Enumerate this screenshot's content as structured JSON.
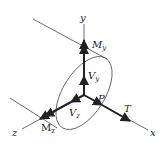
{
  "diagram": {
    "colors": {
      "line": "#222222",
      "thin": "#444444",
      "background": "#ffffff"
    },
    "axes": {
      "x": {
        "label": "x"
      },
      "y": {
        "label": "y"
      },
      "z": {
        "label": "z"
      }
    },
    "point": {
      "label": "P"
    },
    "forces": {
      "T": {
        "label": "T"
      },
      "Vy": {
        "main": "V",
        "sub": "y"
      },
      "Vz": {
        "main": "V",
        "sub": "z"
      },
      "My": {
        "main": "M",
        "sub": "y"
      },
      "Mz": {
        "main": "M",
        "sub": "z"
      }
    }
  }
}
